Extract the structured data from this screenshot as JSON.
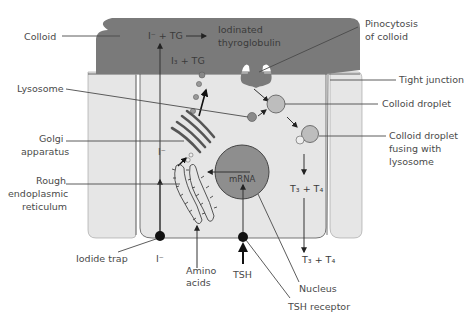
{
  "colors": {
    "colloid": "#7a7a7a",
    "cytoplasm": "#e6e6e6",
    "nucleus": "#8e8e8e",
    "droplet": "#bdbdbd",
    "lysosome": "#8a8a8a",
    "label_text": "#4a4a4a",
    "background": "#ffffff"
  },
  "labels": {
    "colloid": "Colloid",
    "lysosome": "Lysosome",
    "golgi": [
      "Golgi",
      "apparatus"
    ],
    "rer": [
      "Rough",
      "endoplasmic",
      "reticulum"
    ],
    "iodide_trap": "Iodide trap",
    "amino_acids": [
      "Amino",
      "acids"
    ],
    "tsh": "TSH",
    "tsh_receptor": "TSH receptor",
    "nucleus": "Nucleus",
    "pinocytosis": [
      "Pinocytosis",
      "of colloid"
    ],
    "tight_junction": "Tight junction",
    "colloid_droplet": "Colloid droplet",
    "droplet_fusing": [
      "Colloid droplet",
      "fusing with",
      "lysosome"
    ],
    "iodinated_tg": [
      "Iodinated",
      "thyroglobulin"
    ],
    "mrna": "mRNA"
  },
  "chemistry": {
    "iodide_plus_tg": "I⁻ + TG",
    "i3_plus_tg": "I₃ + TG",
    "iodide_mid": "I⁻",
    "iodide_bottom": "I⁻",
    "t3_t4_inside": "T₃ + T₄",
    "t3_t4_outside": "T₃ + T₄"
  }
}
